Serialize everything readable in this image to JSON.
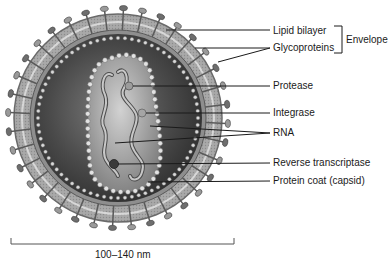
{
  "diagram": {
    "labels": [
      {
        "id": "lipid-bilayer",
        "text": "Lipid bilayer",
        "x": 273,
        "y": 25
      },
      {
        "id": "glycoproteins",
        "text": "Glycoproteins",
        "x": 273,
        "y": 42
      },
      {
        "id": "protease",
        "text": "Protease",
        "x": 273,
        "y": 80
      },
      {
        "id": "integrase",
        "text": "Integrase",
        "x": 273,
        "y": 107
      },
      {
        "id": "rna",
        "text": "RNA",
        "x": 273,
        "y": 127
      },
      {
        "id": "reverse-transcriptase",
        "text": "Reverse transcriptase",
        "x": 273,
        "y": 157
      },
      {
        "id": "protein-coat",
        "text": "Protein coat (capsid)",
        "x": 273,
        "y": 175
      }
    ],
    "group_label": {
      "text": "Envelope",
      "groups": [
        "Lipid bilayer",
        "Glycoproteins"
      ]
    },
    "scale_bar": {
      "text": "100–140 nm"
    },
    "colors": {
      "background": "#ffffff",
      "envelope_outer": "#8a8a8a",
      "envelope_band": "#b8b8b8",
      "interior_dark": "#3a3a3a",
      "interior_mid": "#6d6d6d",
      "capsid_fill": "#9a9a9a",
      "bead": "#d8d8d8",
      "line": "#1a1a1a"
    }
  }
}
